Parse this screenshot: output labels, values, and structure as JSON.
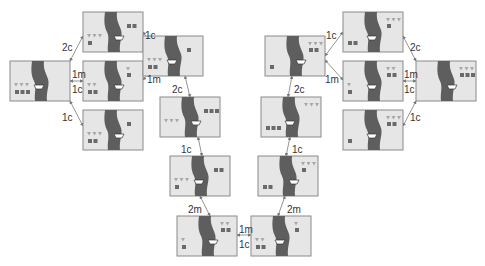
{
  "colors": {
    "bank": "#e6e6e6",
    "border": "#8a8a8a",
    "river": "#5e5e5e",
    "missionary": "#6a6a6a",
    "cannibal": "#a8a8a8",
    "boat": "#ffffff",
    "edge": "#888888",
    "label": "#333333"
  },
  "legend": {
    "missionary_icon": "square",
    "cannibal_icon": "triangle",
    "boat_icon": "boat"
  },
  "states": [
    {
      "id": "L0",
      "x": 10,
      "y": 61,
      "left": {
        "m": 3,
        "c": 3
      },
      "right": {
        "m": 0,
        "c": 0
      },
      "boat": "left"
    },
    {
      "id": "A1",
      "x": 83,
      "y": 12,
      "left": {
        "m": 1,
        "c": 3
      },
      "right": {
        "m": 2,
        "c": 0
      },
      "boat": "right"
    },
    {
      "id": "A2",
      "x": 83,
      "y": 61,
      "left": {
        "m": 2,
        "c": 2
      },
      "right": {
        "m": 1,
        "c": 1
      },
      "boat": "right"
    },
    {
      "id": "A3",
      "x": 83,
      "y": 110,
      "left": {
        "m": 2,
        "c": 3
      },
      "right": {
        "m": 1,
        "c": 0
      },
      "boat": "right"
    },
    {
      "id": "B",
      "x": 143,
      "y": 36,
      "left": {
        "m": 2,
        "c": 3
      },
      "right": {
        "m": 1,
        "c": 0
      },
      "boat": "left"
    },
    {
      "id": "C",
      "x": 160,
      "y": 97,
      "left": {
        "m": 0,
        "c": 3
      },
      "right": {
        "m": 3,
        "c": 0
      },
      "boat": "right"
    },
    {
      "id": "D",
      "x": 170,
      "y": 156,
      "left": {
        "m": 1,
        "c": 3
      },
      "right": {
        "m": 2,
        "c": 0
      },
      "boat": "left"
    },
    {
      "id": "E",
      "x": 177,
      "y": 216,
      "left": {
        "m": 1,
        "c": 1
      },
      "right": {
        "m": 2,
        "c": 2
      },
      "boat": "right"
    },
    {
      "id": "F",
      "x": 251,
      "y": 216,
      "left": {
        "m": 2,
        "c": 2
      },
      "right": {
        "m": 1,
        "c": 1
      },
      "boat": "left"
    },
    {
      "id": "G",
      "x": 258,
      "y": 156,
      "left": {
        "m": 2,
        "c": 0
      },
      "right": {
        "m": 1,
        "c": 3
      },
      "boat": "right"
    },
    {
      "id": "H",
      "x": 261,
      "y": 97,
      "left": {
        "m": 3,
        "c": 0
      },
      "right": {
        "m": 0,
        "c": 3
      },
      "boat": "left"
    },
    {
      "id": "I",
      "x": 265,
      "y": 36,
      "left": {
        "m": 1,
        "c": 0
      },
      "right": {
        "m": 2,
        "c": 3
      },
      "boat": "right"
    },
    {
      "id": "J1",
      "x": 343,
      "y": 12,
      "left": {
        "m": 2,
        "c": 0
      },
      "right": {
        "m": 1,
        "c": 3
      },
      "boat": "left"
    },
    {
      "id": "J2",
      "x": 343,
      "y": 61,
      "left": {
        "m": 1,
        "c": 1
      },
      "right": {
        "m": 2,
        "c": 2
      },
      "boat": "left"
    },
    {
      "id": "J3",
      "x": 343,
      "y": 110,
      "left": {
        "m": 1,
        "c": 0
      },
      "right": {
        "m": 2,
        "c": 3
      },
      "boat": "left"
    },
    {
      "id": "K",
      "x": 416,
      "y": 61,
      "left": {
        "m": 0,
        "c": 0
      },
      "right": {
        "m": 3,
        "c": 3
      },
      "boat": "right"
    }
  ],
  "edges": [
    {
      "from": "L0",
      "to": "A1",
      "label": "2c",
      "lx": 62,
      "ly": 43,
      "x1": 70,
      "y1": 61,
      "x2": 83,
      "y2": 36
    },
    {
      "from": "L0",
      "to": "A2",
      "label": "1m",
      "lx": 72,
      "ly": 70,
      "x1": 70,
      "y1": 81,
      "x2": 83,
      "y2": 81,
      "double": true,
      "label2": "1c",
      "l2x": 72,
      "l2y": 85
    },
    {
      "from": "L0",
      "to": "A3",
      "label": "1c",
      "lx": 62,
      "ly": 113,
      "x1": 70,
      "y1": 101,
      "x2": 83,
      "y2": 126
    },
    {
      "from": "A1",
      "to": "B",
      "label": "1c",
      "lx": 145,
      "ly": 31,
      "x1": 143,
      "y1": 32,
      "x2": 160,
      "y2": 56
    },
    {
      "from": "A2",
      "to": "B",
      "label": "1m",
      "lx": 147,
      "ly": 75,
      "x1": 143,
      "y1": 80,
      "x2": 160,
      "y2": 60
    },
    {
      "from": "B",
      "to": "C",
      "label": "2c",
      "lx": 172,
      "ly": 85,
      "x1": 185,
      "y1": 76,
      "x2": 190,
      "y2": 97
    },
    {
      "from": "C",
      "to": "D",
      "label": "1c",
      "lx": 181,
      "ly": 145,
      "x1": 198,
      "y1": 137,
      "x2": 202,
      "y2": 156
    },
    {
      "from": "D",
      "to": "E",
      "label": "2m",
      "lx": 188,
      "ly": 205,
      "x1": 200,
      "y1": 196,
      "x2": 210,
      "y2": 216
    },
    {
      "from": "E",
      "to": "F",
      "label": "1m",
      "lx": 239,
      "ly": 225,
      "x1": 237,
      "y1": 235,
      "x2": 251,
      "y2": 235,
      "double": true,
      "label2": "1c",
      "l2x": 239,
      "l2y": 240
    },
    {
      "from": "G",
      "to": "F",
      "label": "2m",
      "lx": 287,
      "ly": 205,
      "x1": 285,
      "y1": 196,
      "x2": 278,
      "y2": 216
    },
    {
      "from": "H",
      "to": "G",
      "label": "1c",
      "lx": 292,
      "ly": 145,
      "x1": 290,
      "y1": 137,
      "x2": 286,
      "y2": 156
    },
    {
      "from": "I",
      "to": "H",
      "label": "2c",
      "lx": 294,
      "ly": 85,
      "x1": 292,
      "y1": 76,
      "x2": 288,
      "y2": 97
    },
    {
      "from": "I",
      "to": "J1",
      "label": "1c",
      "lx": 326,
      "ly": 31,
      "x1": 325,
      "y1": 56,
      "x2": 343,
      "y2": 32
    },
    {
      "from": "I",
      "to": "J2",
      "label": "1m",
      "lx": 325,
      "ly": 75,
      "x1": 325,
      "y1": 60,
      "x2": 343,
      "y2": 80
    },
    {
      "from": "J1",
      "to": "K",
      "label": "2c",
      "lx": 410,
      "ly": 43,
      "x1": 403,
      "y1": 36,
      "x2": 416,
      "y2": 61
    },
    {
      "from": "J2",
      "to": "K",
      "label": "1m",
      "lx": 404,
      "ly": 70,
      "x1": 403,
      "y1": 81,
      "x2": 416,
      "y2": 81,
      "double": true,
      "label2": "1c",
      "l2x": 404,
      "l2y": 85
    },
    {
      "from": "J3",
      "to": "K",
      "label": "1c",
      "lx": 410,
      "ly": 113,
      "x1": 403,
      "y1": 126,
      "x2": 416,
      "y2": 101
    }
  ]
}
